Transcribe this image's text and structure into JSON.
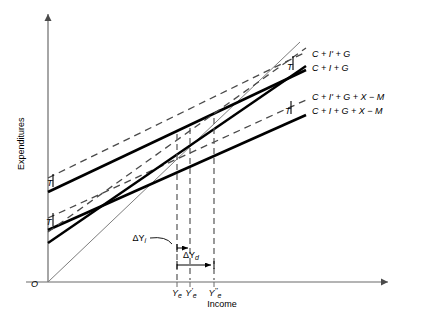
{
  "figure": {
    "type": "keynesian-cross-diagram",
    "axes": {
      "y_label": "Expenditures",
      "x_label": "Income",
      "origin_label": "O"
    },
    "x_ticks": [
      {
        "id": "Ye",
        "base": "Y",
        "sub": "e",
        "prime": "",
        "x": 177
      },
      {
        "id": "Ye1",
        "base": "Y",
        "sub": "e",
        "prime": "'",
        "x": 190
      },
      {
        "id": "Ye2",
        "base": "Y",
        "sub": "e",
        "prime": "''",
        "x": 214
      }
    ],
    "curve_labels": [
      {
        "id": "cig-prime",
        "text": "C + I' + G",
        "style": "dashed",
        "x": 312,
        "y": 54
      },
      {
        "id": "cig",
        "text": "C + I + G",
        "style": "solid",
        "x": 312,
        "y": 68
      },
      {
        "id": "cigxm-prime",
        "text": "C + I' + G + X − M",
        "style": "dashed",
        "x": 312,
        "y": 97
      },
      {
        "id": "cigxm",
        "text": "C + I + G + X − M",
        "style": "solid",
        "x": 312,
        "y": 111
      }
    ],
    "tax_markers": [
      {
        "id": "T-left-upper",
        "label": "T",
        "x": 47,
        "y": 181
      },
      {
        "id": "T-left-lower",
        "label": "T",
        "x": 47,
        "y": 219
      },
      {
        "id": "T-right-upper",
        "label": "T",
        "x": 290,
        "y": 66
      },
      {
        "id": "T-right-lower",
        "label": "T",
        "x": 288,
        "y": 110
      }
    ],
    "annotations": [
      {
        "id": "delta-Yi",
        "base": "ΔY",
        "sub": "i",
        "x": 148,
        "y": 239
      },
      {
        "id": "delta-Yd",
        "base": "ΔY",
        "sub": "d",
        "x": 185,
        "y": 258
      }
    ],
    "colors": {
      "line": "#000000",
      "axis": "#6b6b6b",
      "dashed": "#555555",
      "background": "#ffffff"
    }
  }
}
